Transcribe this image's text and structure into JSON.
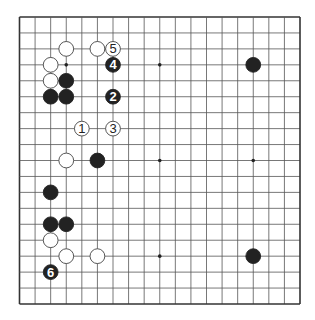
{
  "board": {
    "size": 19,
    "left": 19.5,
    "top": 17,
    "right": 300,
    "bottom": 304,
    "line_color": "#555555",
    "edge_color": "#333333",
    "stone_black": "#222222",
    "stone_white": "#ffffff",
    "stone_outline": "#444444",
    "star_points": [
      [
        3,
        3
      ],
      [
        9,
        3
      ],
      [
        15,
        3
      ],
      [
        3,
        9
      ],
      [
        9,
        9
      ],
      [
        15,
        9
      ],
      [
        3,
        15
      ],
      [
        9,
        15
      ],
      [
        15,
        15
      ]
    ]
  },
  "stones": [
    {
      "col": 3,
      "row": 2,
      "color": "white",
      "label": ""
    },
    {
      "col": 5,
      "row": 2,
      "color": "white",
      "label": ""
    },
    {
      "col": 6,
      "row": 2,
      "color": "white",
      "label": "5"
    },
    {
      "col": 6,
      "row": 3,
      "color": "black",
      "label": "4"
    },
    {
      "col": 2,
      "row": 3,
      "color": "white",
      "label": ""
    },
    {
      "col": 2,
      "row": 4,
      "color": "white",
      "label": ""
    },
    {
      "col": 3,
      "row": 4,
      "color": "black",
      "label": ""
    },
    {
      "col": 2,
      "row": 5,
      "color": "black",
      "label": ""
    },
    {
      "col": 3,
      "row": 5,
      "color": "black",
      "label": ""
    },
    {
      "col": 6,
      "row": 5,
      "color": "black",
      "label": "2"
    },
    {
      "col": 4,
      "row": 7,
      "color": "white",
      "label": "1"
    },
    {
      "col": 6,
      "row": 7,
      "color": "white",
      "label": "3"
    },
    {
      "col": 3,
      "row": 9,
      "color": "white",
      "label": ""
    },
    {
      "col": 5,
      "row": 9,
      "color": "black",
      "label": ""
    },
    {
      "col": 15,
      "row": 3,
      "color": "black",
      "label": ""
    },
    {
      "col": 2,
      "row": 11,
      "color": "black",
      "label": ""
    },
    {
      "col": 2,
      "row": 13,
      "color": "black",
      "label": ""
    },
    {
      "col": 3,
      "row": 13,
      "color": "black",
      "label": ""
    },
    {
      "col": 2,
      "row": 14,
      "color": "white",
      "label": ""
    },
    {
      "col": 3,
      "row": 15,
      "color": "white",
      "label": ""
    },
    {
      "col": 5,
      "row": 15,
      "color": "white",
      "label": ""
    },
    {
      "col": 2,
      "row": 16,
      "color": "black",
      "label": "6"
    },
    {
      "col": 15,
      "row": 15,
      "color": "black",
      "label": ""
    }
  ]
}
